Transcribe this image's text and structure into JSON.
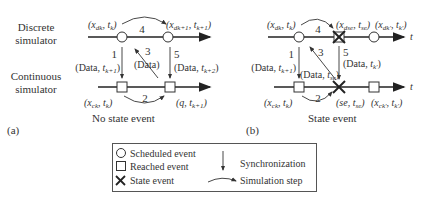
{
  "panel_a": {
    "tag": "(a)",
    "caption": "No state event",
    "discrete_label_1": "Discrete",
    "discrete_label_2": "simulator",
    "continuous_label_1": "Continuous",
    "continuous_label_2": "simulator",
    "top_left_state": "(x_dk, t_k)",
    "top_right_state": "(x_dk+1, t_k+1)",
    "bottom_left_state": "(x_ck, t_k)",
    "bottom_right_state": "(q, t_k+1)",
    "step1": "1",
    "step1_label": "(Data, t_k+1)",
    "step2": "2",
    "step3": "3",
    "step3_label": "(Data)",
    "step4": "4",
    "step5": "5",
    "step5_label": "(Data, t_k+2)"
  },
  "panel_b": {
    "tag": "(b)",
    "caption": "State event",
    "axis_t": "t",
    "top_left_state": "(x_dk, t_k)",
    "top_mid_state": "(x_dse, t_se)",
    "top_right_state": "(x_dk', t_k')",
    "bottom_left_state": "(x_ck, t_k)",
    "bottom_mid_state": "(se, t_se)",
    "bottom_right_state": "(x_ck', t_k')",
    "step1": "1",
    "step1_label": "(Data, t_k+1)",
    "step2": "2",
    "step3": "3",
    "step3_label": "(Data, t_se)",
    "step4": "4",
    "step5": "5",
    "step5_label": "(Data, t_k')"
  },
  "legend": {
    "scheduled": "Scheduled event",
    "reached": "Reached event",
    "state": "State event",
    "sync": "Synchronization",
    "step": "Simulation step"
  }
}
